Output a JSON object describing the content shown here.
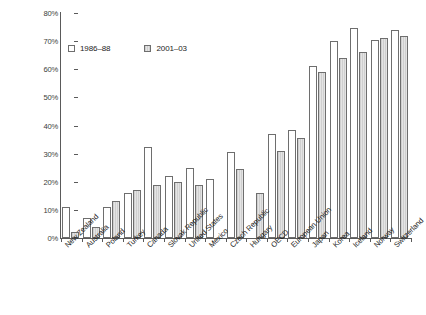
{
  "chart_data": {
    "type": "bar",
    "title": "",
    "xlabel": "",
    "ylabel": "",
    "ylim": [
      0,
      80
    ],
    "ytick_labels": [
      "0%",
      "10%",
      "20%",
      "30%",
      "40%",
      "50%",
      "60%",
      "70%",
      "80%"
    ],
    "ytick_values": [
      0,
      10,
      20,
      30,
      40,
      50,
      60,
      70,
      80
    ],
    "grid": false,
    "legend_position": "upper-left-inside",
    "categories": [
      "New Zealand",
      "Australia",
      "Poland",
      "Turkey",
      "Canada",
      "Slovak Republic",
      "United States",
      "Mexico",
      "Czech Republic",
      "Hungary",
      "OECD",
      "European Union",
      "Japan",
      "Korea",
      "Iceland",
      "Norway",
      "Switzerland"
    ],
    "series": [
      {
        "name": "1986–88",
        "color": "#ffffff",
        "values": [
          11,
          7,
          11,
          16,
          32.5,
          22,
          25,
          21,
          30.5,
          null,
          37,
          38.5,
          61,
          70,
          74.5,
          70.5,
          74
        ]
      },
      {
        "name": "2001–03",
        "color": "#d8d8d8",
        "values": [
          2,
          4,
          13,
          17,
          19,
          20,
          19,
          null,
          24.5,
          16,
          31,
          35.5,
          59,
          64,
          66,
          71,
          72
        ]
      }
    ]
  },
  "legend": {
    "items": [
      {
        "label": "1986–88",
        "swatch": "open-square-swatch"
      },
      {
        "label": "2001–03",
        "swatch": "shaded-square-swatch"
      }
    ]
  },
  "colors": {
    "series_1986_88": "#ffffff",
    "series_2001_03": "#d8d8d8",
    "axis": "#5a5a5a",
    "bar_outline": "#6e6e6e",
    "text": "#1d1d1d",
    "background": "#ffffff"
  }
}
